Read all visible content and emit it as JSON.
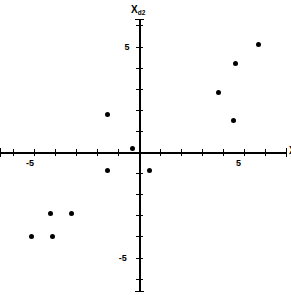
{
  "chart_data": {
    "type": "scatter",
    "title": "",
    "xlabel": "X_d1",
    "ylabel": "X_d2",
    "xlabel_base": "X",
    "xlabel_sub": "d1",
    "ylabel_base": "X",
    "ylabel_sub": "d2",
    "xlim": [
      -6.6,
      7.0
    ],
    "ylim": [
      -6.6,
      6.3
    ],
    "grid": false,
    "legend": null,
    "xticks": [
      -6,
      -5,
      -4,
      -3,
      -2,
      -1,
      1,
      2,
      3,
      4,
      5,
      6
    ],
    "yticks": [
      -6,
      -5,
      -4,
      -3,
      -2,
      -1,
      1,
      2,
      3,
      4,
      5,
      6
    ],
    "xtick_labels": [
      {
        "value": -5,
        "label": "-5"
      },
      {
        "value": 5,
        "label": "5"
      }
    ],
    "ytick_labels": [
      {
        "value": 5,
        "label": "5"
      },
      {
        "value": -5,
        "label": "-5"
      }
    ],
    "tick_interval": 1,
    "marker": "filled-circle",
    "marker_color": "#000000",
    "axis_color": "#000000",
    "background_color": "#ffffff",
    "points": [
      {
        "x": -0.3,
        "y": 0.15
      },
      {
        "x": -1.5,
        "y": 1.8
      },
      {
        "x": -1.5,
        "y": -0.9
      },
      {
        "x": 0.5,
        "y": -0.9
      },
      {
        "x": -4.2,
        "y": -2.9
      },
      {
        "x": -3.2,
        "y": -2.9
      },
      {
        "x": -5.1,
        "y": -4.0
      },
      {
        "x": -4.1,
        "y": -4.0
      },
      {
        "x": 3.8,
        "y": 2.8
      },
      {
        "x": 4.5,
        "y": 1.5
      },
      {
        "x": 4.6,
        "y": 4.2
      },
      {
        "x": 5.7,
        "y": 5.1
      }
    ]
  }
}
